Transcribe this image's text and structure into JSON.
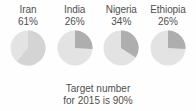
{
  "chart_data": {
    "type": "pie",
    "title": "",
    "subtitle": "",
    "xlabel": "",
    "ylabel": "",
    "legend_position": "none",
    "grid": false,
    "annotations": [
      "Target number",
      "for 2015 is 90%"
    ],
    "target_percent": 90,
    "categories": [
      "Iran",
      "India",
      "Nigeria",
      "Ethiopia"
    ],
    "values": [
      61,
      26,
      34,
      26
    ],
    "series": [
      {
        "name": "Coverage",
        "values": [
          61,
          26,
          34,
          26
        ]
      },
      {
        "name": "Remainder",
        "values": [
          39,
          74,
          66,
          74
        ]
      }
    ],
    "units": "%",
    "charts": [
      {
        "country": "Iran",
        "value_label": "61%",
        "value": 61,
        "remainder": 39,
        "start_angle_deg": 0,
        "sweep_deg": 219.6
      },
      {
        "country": "India",
        "value_label": "26%",
        "value": 26,
        "remainder": 74,
        "start_angle_deg": 0,
        "sweep_deg": 93.6
      },
      {
        "country": "Nigeria",
        "value_label": "34%",
        "value": 34,
        "remainder": 66,
        "start_angle_deg": 0,
        "sweep_deg": 122.4
      },
      {
        "country": "Ethiopia",
        "value_label": "26%",
        "value": 26,
        "remainder": 74,
        "start_angle_deg": 0,
        "sweep_deg": 93.6
      }
    ]
  },
  "colors": {
    "slice_value": "#aeaeae",
    "slice_remainder": "#e3e3e3",
    "slice_value_light": "#d4d4d4",
    "background": "#fefefe",
    "text": "#4f4f4f"
  },
  "caption": {
    "line1": "Target number",
    "line2": "for 2015 is 90%"
  }
}
